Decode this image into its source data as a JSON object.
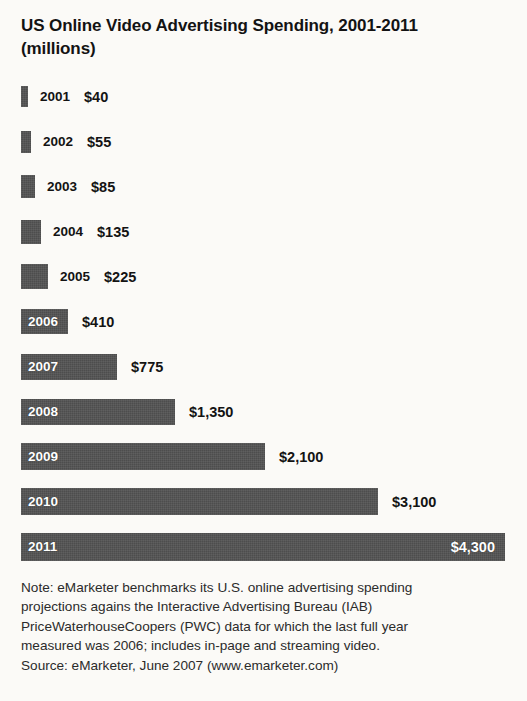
{
  "title": "US Online Video Advertising Spending, 2001-2011 (millions)",
  "chart_data": {
    "type": "bar",
    "orientation": "horizontal",
    "title": "US Online Video Advertising Spending, 2001-2011 (millions)",
    "xlabel": "",
    "ylabel": "",
    "units": "millions of US dollars",
    "grid": false,
    "legend": null,
    "categories": [
      "2001",
      "2002",
      "2003",
      "2004",
      "2005",
      "2006",
      "2007",
      "2008",
      "2009",
      "2010",
      "2011"
    ],
    "values": [
      40,
      55,
      85,
      135,
      225,
      410,
      775,
      1350,
      2100,
      3100,
      4300
    ],
    "value_labels": [
      "$40",
      "$55",
      "$85",
      "$135",
      "$225",
      "$410",
      "$775",
      "$1,350",
      "$2,100",
      "$3,100",
      "$4,300"
    ],
    "xlim": [
      0,
      4300
    ],
    "bar_color": "#4d4d4d",
    "label_color_inside": "#ffffff",
    "label_color_outside": "#131313",
    "rows": [
      {
        "year": "2001",
        "value": 40,
        "label": "$40",
        "bar_px": 7,
        "year_inside": false,
        "value_inside": false
      },
      {
        "year": "2002",
        "value": 55,
        "label": "$55",
        "bar_px": 10,
        "year_inside": false,
        "value_inside": false
      },
      {
        "year": "2003",
        "value": 85,
        "label": "$85",
        "bar_px": 14,
        "year_inside": false,
        "value_inside": false
      },
      {
        "year": "2004",
        "value": 135,
        "label": "$135",
        "bar_px": 20,
        "year_inside": false,
        "value_inside": false
      },
      {
        "year": "2005",
        "value": 225,
        "label": "$225",
        "bar_px": 27,
        "year_inside": false,
        "value_inside": false
      },
      {
        "year": "2006",
        "value": 410,
        "label": "$410",
        "bar_px": 47,
        "year_inside": true,
        "value_inside": false
      },
      {
        "year": "2007",
        "value": 775,
        "label": "$775",
        "bar_px": 96,
        "year_inside": true,
        "value_inside": false
      },
      {
        "year": "2008",
        "value": 1350,
        "label": "$1,350",
        "bar_px": 154,
        "year_inside": true,
        "value_inside": false
      },
      {
        "year": "2009",
        "value": 2100,
        "label": "$2,100",
        "bar_px": 244,
        "year_inside": true,
        "value_inside": false
      },
      {
        "year": "2010",
        "value": 3100,
        "label": "$3,100",
        "bar_px": 357,
        "year_inside": true,
        "value_inside": false
      },
      {
        "year": "2011",
        "value": 4300,
        "label": "$4,300",
        "bar_px": 484,
        "year_inside": true,
        "value_inside": true
      }
    ]
  },
  "note": {
    "lines": [
      "Note: eMarketer benchmarks its U.S. online advertising spending",
      "projections agains the Interactive Advertising Bureau (IAB)",
      "PriceWaterhouseCoopers (PWC) data for which the last full year",
      "measured was 2006; includes in-page and streaming video.",
      "Source: eMarketer, June 2007 (www.emarketer.com)"
    ]
  }
}
